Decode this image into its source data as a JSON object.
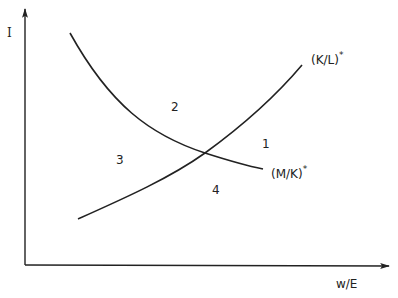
{
  "diagram": {
    "axes": {
      "y_label": "I",
      "x_label": "w/E"
    },
    "curves": [
      {
        "id": "KL",
        "label": "(K/L)",
        "superscript": "*",
        "direction": "upward-sloping"
      },
      {
        "id": "MK",
        "label": "(M/K)",
        "superscript": "*",
        "direction": "downward-sloping"
      }
    ],
    "regions": [
      {
        "id": "1",
        "label": "1"
      },
      {
        "id": "2",
        "label": "2"
      },
      {
        "id": "3",
        "label": "3"
      },
      {
        "id": "4",
        "label": "4"
      }
    ],
    "colors": {
      "ink": "#222222",
      "background": "#ffffff"
    }
  }
}
